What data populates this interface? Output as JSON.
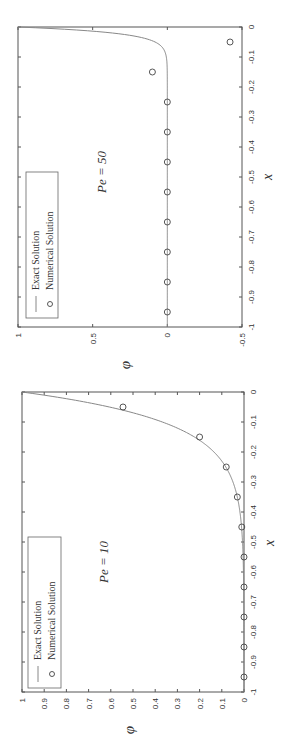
{
  "chart_data": [
    {
      "type": "line",
      "title": "Pe = 10",
      "annotation": "Pe = 10",
      "orientation": "rotated 90° counter-clockwise",
      "xlabel": "x",
      "ylabel": "φ",
      "xlim": [
        -1,
        0
      ],
      "ylim": [
        0,
        1
      ],
      "x_ticks": [
        "-1",
        "-0.9",
        "-0.8",
        "-0.7",
        "-0.6",
        "-0.5",
        "-0.4",
        "-0.3",
        "-0.2",
        "-0.1",
        "0"
      ],
      "y_ticks": [
        "0",
        "0.1",
        "0.2",
        "0.3",
        "0.4",
        "0.5",
        "0.6",
        "0.7",
        "0.8",
        "0.9",
        "1"
      ],
      "legend": [
        "Exact Solution",
        "Numerical Solution"
      ],
      "legend_position": "upper left (unrotated)",
      "series": [
        {
          "name": "Exact Solution",
          "style": "line",
          "pe": 10
        },
        {
          "name": "Numerical Solution",
          "style": "circle-markers",
          "x": [
            -0.95,
            -0.85,
            -0.75,
            -0.65,
            -0.55,
            -0.45,
            -0.35,
            -0.25,
            -0.15,
            -0.05
          ],
          "y": [
            0.0,
            0.0,
            0.0,
            0.0,
            0.0,
            0.01,
            0.03,
            0.08,
            0.2,
            0.545
          ]
        }
      ]
    },
    {
      "type": "line",
      "title": "Pe = 50",
      "annotation": "Pe = 50",
      "orientation": "rotated 90° counter-clockwise",
      "xlabel": "x",
      "ylabel": "φ",
      "xlim": [
        -1,
        0
      ],
      "ylim": [
        -0.5,
        1
      ],
      "x_ticks": [
        "-1",
        "-0.9",
        "-0.8",
        "-0.7",
        "-0.6",
        "-0.5",
        "-0.4",
        "-0.3",
        "-0.2",
        "-0.1",
        "0"
      ],
      "y_ticks": [
        "-0.5",
        "0",
        "0.5",
        "1"
      ],
      "legend": [
        "Exact Solution",
        "Numerical Solution"
      ],
      "legend_position": "upper left (unrotated)",
      "series": [
        {
          "name": "Exact Solution",
          "style": "line",
          "pe": 50
        },
        {
          "name": "Numerical Solution",
          "style": "circle-markers",
          "x": [
            -0.95,
            -0.85,
            -0.75,
            -0.65,
            -0.55,
            -0.45,
            -0.35,
            -0.25,
            -0.15,
            -0.05
          ],
          "y": [
            0.0,
            0.0,
            0.0,
            0.0,
            0.0,
            0.0,
            0.0,
            0.0,
            0.1,
            -0.42
          ]
        }
      ]
    }
  ],
  "labels": {
    "pe10": "Pe = 10",
    "pe50": "Pe = 50",
    "x_axis": "x",
    "phi_axis": "φ",
    "legend_exact": "Exact Solution",
    "legend_numerical": "Numerical Solution"
  }
}
